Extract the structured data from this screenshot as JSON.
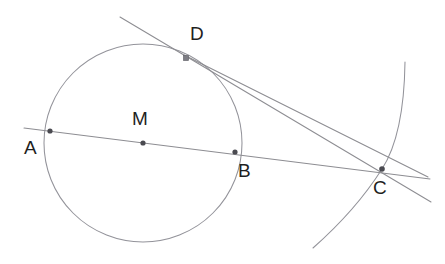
{
  "figure": {
    "canvas": {
      "width": 445,
      "height": 264
    },
    "colors": {
      "background": "#ffffff",
      "line": "#8d8d92",
      "curve": "#93939a",
      "point": "#4a4a50",
      "label": "#1f1f1f"
    },
    "points": [
      {
        "id": "A",
        "label": "A",
        "x": 50,
        "y": 131,
        "label_x": 24,
        "label_y": 138,
        "marker": "dot"
      },
      {
        "id": "M",
        "label": "M",
        "x": 143,
        "y": 143,
        "label_x": 132,
        "label_y": 109,
        "marker": "dot"
      },
      {
        "id": "B",
        "label": "B",
        "x": 235,
        "y": 152,
        "label_x": 238,
        "label_y": 161,
        "marker": "dot"
      },
      {
        "id": "D",
        "label": "D",
        "x": 186,
        "y": 58,
        "label_x": 190,
        "label_y": 24,
        "marker": "square"
      },
      {
        "id": "C",
        "label": "C",
        "x": 382,
        "y": 169,
        "label_x": 373,
        "label_y": 178,
        "marker": "dot"
      }
    ],
    "circle": {
      "id": "circle-M",
      "center_x": 143,
      "center_y": 143,
      "radius": 99
    },
    "arc": {
      "id": "arc-through-C",
      "path": "M 405 62 Q 404 135 382 169 Q 356 210 313 248"
    },
    "lines": [
      {
        "id": "line-ABC",
        "x1": 24,
        "y1": 128,
        "x2": 430,
        "y2": 179,
        "desc": "secant through A, M, B extended to C"
      },
      {
        "id": "line-tangent",
        "x1": 120,
        "y1": 17,
        "x2": 431,
        "y2": 202,
        "desc": "tangent touching circle at D passing through C"
      },
      {
        "id": "line-DC",
        "x1": 184,
        "y1": 55,
        "x2": 428,
        "y2": 177,
        "desc": "segment from D to C"
      }
    ]
  }
}
